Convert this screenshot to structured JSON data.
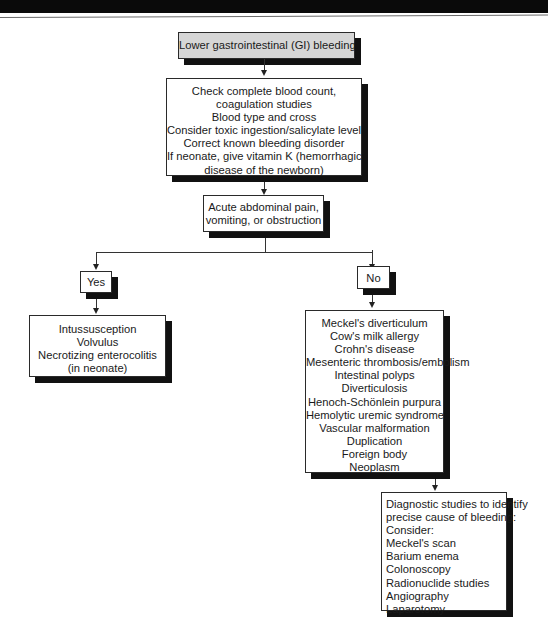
{
  "page": {
    "header_band": "",
    "flowchart_title": "Lower gastrointestinal (GI) bleeding"
  },
  "flowchart": {
    "start": {
      "label": "Lower gastrointestinal (GI) bleeding"
    },
    "initial_steps": {
      "lines": [
        "Check complete blood count,",
        "coagulation studies",
        "Blood type and cross",
        "Consider toxic ingestion/salicylate level",
        "Correct known bleeding disorder",
        "If neonate, give vitamin K (hemorrhagic",
        "disease of the newborn)"
      ]
    },
    "decision": {
      "lines": [
        "Acute abdominal pain,",
        "vomiting, or obstruction"
      ]
    },
    "yes_branch": {
      "label": "Yes",
      "diagnoses": [
        "Intussusception",
        "Volvulus",
        "Necrotizing enterocolitis",
        "(in neonate)"
      ]
    },
    "no_branch": {
      "label": "No",
      "diagnoses": [
        "Meckel's diverticulum",
        "Cow's milk allergy",
        "Crohn's disease",
        "Mesenteric thrombosis/embolism",
        "Intestinal polyps",
        "Diverticulosis",
        "Henoch-Schönlein purpura",
        "Hemolytic uremic syndrome",
        "Vascular malformation",
        "Duplication",
        "Foreign body",
        "Neoplasm"
      ],
      "diagnostic_studies": {
        "intro_lines": [
          "Diagnostic studies to identify",
          "precise cause of bleeding:",
          "Consider:"
        ],
        "studies": [
          "Meckel's scan",
          "Barium enema",
          "Colonoscopy",
          "Radionuclide studies",
          "Angiography",
          "Laparotomy"
        ]
      }
    }
  },
  "colors": {
    "start_box_fill": "#d6d6d6",
    "box_fill": "#ffffff",
    "shadow": "#111111",
    "line": "#333333",
    "header_band": "#0a0a0a"
  }
}
